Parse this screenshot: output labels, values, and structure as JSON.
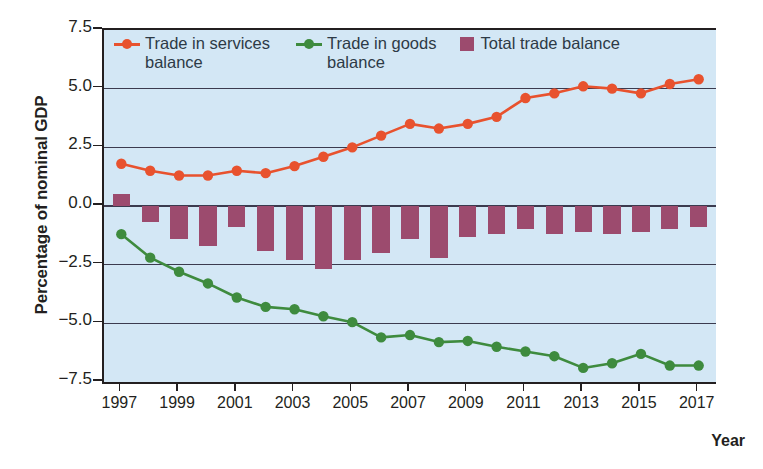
{
  "chart_data": {
    "type": "line",
    "title": "",
    "xlabel": "Year",
    "ylabel": "Percentage of nominal GDP",
    "xlim": [
      1996.4,
      2017.6
    ],
    "ylim": [
      -7.5,
      7.5
    ],
    "ytick_labels": [
      "7.5",
      "5.0",
      "2.5",
      "0.0",
      "−2.5",
      "−5.0",
      "−7.5"
    ],
    "ytick_values": [
      7.5,
      5.0,
      2.5,
      0.0,
      -2.5,
      -5.0,
      -7.5
    ],
    "xtick_labels": [
      "1997",
      "1999",
      "2001",
      "2003",
      "2005",
      "2007",
      "2009",
      "2011",
      "2013",
      "2015",
      "2017"
    ],
    "xtick_values": [
      1997,
      1999,
      2001,
      2003,
      2005,
      2007,
      2009,
      2011,
      2013,
      2015,
      2017
    ],
    "x": [
      1997,
      1998,
      1999,
      2000,
      2001,
      2002,
      2003,
      2004,
      2005,
      2006,
      2007,
      2008,
      2009,
      2010,
      2011,
      2012,
      2013,
      2014,
      2015,
      2016,
      2017
    ],
    "grid": true,
    "legend_position": "top-inside",
    "plot_background": "#d3e7f5",
    "series": [
      {
        "name": "Trade in services balance",
        "legend_label_line1": "Trade in services",
        "legend_label_line2": "balance",
        "type": "line",
        "color": "#e8522e",
        "marker": "circle",
        "values": [
          1.8,
          1.5,
          1.3,
          1.3,
          1.5,
          1.4,
          1.7,
          2.1,
          2.5,
          3.0,
          3.5,
          3.3,
          3.5,
          3.8,
          4.6,
          4.8,
          5.1,
          5.0,
          4.8,
          5.2,
          5.4
        ]
      },
      {
        "name": "Trade in goods balance",
        "legend_label_line1": "Trade in goods",
        "legend_label_line2": "balance",
        "type": "line",
        "color": "#3e8b3e",
        "marker": "circle",
        "values": [
          -1.2,
          -2.2,
          -2.8,
          -3.3,
          -3.9,
          -4.3,
          -4.4,
          -4.7,
          -4.95,
          -5.6,
          -5.5,
          -5.8,
          -5.75,
          -6.0,
          -6.2,
          -6.4,
          -6.9,
          -6.7,
          -6.3,
          -6.8,
          -6.8
        ]
      },
      {
        "name": "Total trade balance",
        "legend_label_line1": "Total trade balance",
        "legend_label_line2": "",
        "type": "bar",
        "color": "#9c4b6e",
        "values": [
          0.5,
          -0.7,
          -1.4,
          -1.7,
          -0.9,
          -1.9,
          -2.3,
          -2.7,
          -2.3,
          -2.0,
          -1.4,
          -2.2,
          -1.3,
          -1.2,
          -1.0,
          -1.2,
          -1.1,
          -1.2,
          -1.1,
          -1.0,
          -0.9
        ]
      }
    ]
  }
}
